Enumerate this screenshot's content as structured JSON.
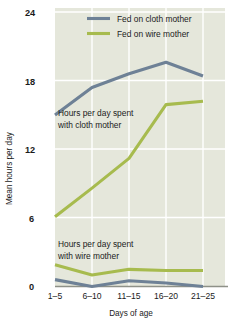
{
  "chart_data": {
    "type": "line",
    "title": "",
    "xlabel": "Days of age",
    "ylabel": "Mean hours per day",
    "categories": [
      "1–5",
      "6–10",
      "11–15",
      "16–20",
      "21–25"
    ],
    "ylim": [
      0,
      24
    ],
    "yticks": [
      0,
      6,
      12,
      18,
      24
    ],
    "ytick_labels": [
      "0",
      "6",
      "12",
      "18",
      "24"
    ],
    "grid": true,
    "legend_position": "top-right",
    "series": [
      {
        "name": "Fed on cloth mother",
        "color": "#6e8196",
        "comment_cloth_time": "hours per day spent with cloth mother",
        "values": [
          15.0,
          17.4,
          18.6,
          19.6,
          18.4
        ]
      },
      {
        "name": "Fed on wire mother",
        "color": "#a7bb4e",
        "comment_cloth_time": "hours per day spent with cloth mother",
        "values": [
          6.1,
          8.6,
          11.2,
          15.9,
          16.2
        ]
      },
      {
        "name": "Fed on wire mother",
        "color": "#a7bb4e",
        "comment_wire_time": "hours per day spent with wire mother",
        "values": [
          1.9,
          1.0,
          1.5,
          1.4,
          1.4
        ]
      },
      {
        "name": "Fed on cloth mother",
        "color": "#6e8196",
        "comment_wire_time": "hours per day spent with wire mother",
        "values": [
          0.6,
          0.0,
          0.5,
          0.3,
          0.0
        ]
      }
    ]
  },
  "legend": {
    "items": [
      {
        "label": "Fed on cloth mother",
        "color": "#6e8196"
      },
      {
        "label": "Fed on wire mother",
        "color": "#a7bb4e"
      }
    ]
  },
  "annotations": {
    "cloth": {
      "line1": "Hours per day spent",
      "line2": "with cloth mother"
    },
    "wire": {
      "line1": "Hours per day spent",
      "line2": "with wire mother"
    }
  },
  "axes": {
    "y_title": "Mean hours per day",
    "x_title": "Days of age",
    "y_labels": [
      "24",
      "18",
      "12",
      "6",
      "0"
    ],
    "x_labels": [
      "1–5",
      "6–10",
      "11–15",
      "16–20",
      "21–25"
    ]
  },
  "colors": {
    "plot_background": "#e5e7db",
    "gridline": "#ffffff",
    "cloth_series": "#6e8196",
    "wire_series": "#a7bb4e",
    "text": "#1b1b1b",
    "baseline": "#8e9188"
  }
}
